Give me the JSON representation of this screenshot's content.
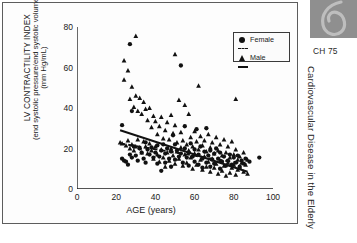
{
  "figure": {
    "chapter_label": "CH 75",
    "running_head": "Cardiovascular Disease in the Elderly",
    "ornament_icon": "swirl-ornament-icon"
  },
  "axes": {
    "ylabel_line1": "LV CONTRACTILITY INDEX",
    "ylabel_line2": "(end systolic pressure/end systolic volume)",
    "ylabel_line3": "(mm Hg/mL)",
    "xlabel": "AGE (years)",
    "yticks": [
      "0",
      "20",
      "40",
      "60",
      "80"
    ],
    "xticks": [
      "0",
      "20",
      "40",
      "60",
      "80",
      "100"
    ]
  },
  "legend": {
    "items": [
      {
        "label": "Female",
        "marker": "circle-marker",
        "line": "dashed-line"
      },
      {
        "label": "Male",
        "marker": "triangle-marker",
        "line": "solid-line"
      }
    ]
  },
  "colors": {
    "marker": "#111111",
    "axis": "#1a1a1a",
    "panel_border": "#5d5d5d",
    "side_block": "#8f8f8f"
  },
  "chart_data": {
    "type": "scatter",
    "title": "",
    "xlabel": "AGE (years)",
    "ylabel": "LV CONTRACTILITY INDEX (end systolic pressure/end systolic volume) (mm Hg/mL)",
    "xlim": [
      0,
      100
    ],
    "ylim": [
      0,
      80
    ],
    "xticks": [
      0,
      20,
      40,
      60,
      80,
      100
    ],
    "yticks": [
      0,
      20,
      40,
      60,
      80
    ],
    "grid": false,
    "legend_position": "top-right",
    "series": [
      {
        "name": "Female",
        "marker": "circle",
        "trendline": {
          "style": "dashed",
          "x": [
            22,
            88
          ],
          "y": [
            22.5,
            12.0
          ]
        },
        "points": [
          [
            23,
            31.5
          ],
          [
            23,
            15.0
          ],
          [
            24,
            14.0
          ],
          [
            25,
            13.5
          ],
          [
            26,
            12.0
          ],
          [
            27,
            71.5
          ],
          [
            27,
            17.0
          ],
          [
            28,
            38.5
          ],
          [
            28,
            15.5
          ],
          [
            29,
            21.0
          ],
          [
            30,
            16.5
          ],
          [
            31,
            14.0
          ],
          [
            32,
            20.0
          ],
          [
            33,
            18.0
          ],
          [
            34,
            15.0
          ],
          [
            35,
            23.0
          ],
          [
            35,
            13.0
          ],
          [
            36,
            19.5
          ],
          [
            37,
            17.0
          ],
          [
            38,
            20.5
          ],
          [
            39,
            15.5
          ],
          [
            40,
            18.0
          ],
          [
            41,
            21.5
          ],
          [
            41,
            12.5
          ],
          [
            42,
            16.0
          ],
          [
            43,
            19.0
          ],
          [
            43,
            9.0
          ],
          [
            44,
            22.0
          ],
          [
            45,
            17.5
          ],
          [
            45,
            13.0
          ],
          [
            46,
            20.0
          ],
          [
            47,
            15.0
          ],
          [
            48,
            18.5
          ],
          [
            48,
            11.0
          ],
          [
            49,
            26.5
          ],
          [
            50,
            22.0
          ],
          [
            50,
            14.5
          ],
          [
            51,
            19.0
          ],
          [
            52,
            16.0
          ],
          [
            53,
            61.0
          ],
          [
            53,
            17.5
          ],
          [
            54,
            13.0
          ],
          [
            55,
            31.0
          ],
          [
            55,
            20.0
          ],
          [
            56,
            15.5
          ],
          [
            57,
            18.0
          ],
          [
            57,
            11.5
          ],
          [
            58,
            22.5
          ],
          [
            59,
            16.0
          ],
          [
            60,
            19.5
          ],
          [
            60,
            13.5
          ],
          [
            61,
            29.5
          ],
          [
            62,
            17.0
          ],
          [
            62,
            12.0
          ],
          [
            63,
            21.0
          ],
          [
            64,
            15.0
          ],
          [
            64,
            10.5
          ],
          [
            65,
            18.5
          ],
          [
            66,
            30.0
          ],
          [
            66,
            13.0
          ],
          [
            67,
            16.5
          ],
          [
            68,
            19.0
          ],
          [
            68,
            11.0
          ],
          [
            69,
            14.5
          ],
          [
            70,
            17.5
          ],
          [
            70,
            12.5
          ],
          [
            71,
            20.0
          ],
          [
            72,
            15.0
          ],
          [
            73,
            18.0
          ],
          [
            73,
            10.0
          ],
          [
            74,
            13.5
          ],
          [
            75,
            16.0
          ],
          [
            76,
            11.5
          ],
          [
            77,
            14.0
          ],
          [
            78,
            17.0
          ],
          [
            79,
            12.0
          ],
          [
            80,
            15.5
          ],
          [
            81,
            13.0
          ],
          [
            82,
            16.5
          ],
          [
            83,
            11.0
          ],
          [
            84,
            14.0
          ],
          [
            85,
            12.5
          ],
          [
            86,
            15.0
          ],
          [
            88,
            13.5
          ],
          [
            93,
            15.5
          ]
        ]
      },
      {
        "name": "Male",
        "marker": "triangle",
        "trendline": {
          "style": "solid",
          "x": [
            22,
            87
          ],
          "y": [
            29.0,
            8.5
          ]
        },
        "points": [
          [
            22,
            23.0
          ],
          [
            23,
            22.5
          ],
          [
            24,
            63.5
          ],
          [
            24,
            54.0
          ],
          [
            25,
            21.5
          ],
          [
            26,
            58.5
          ],
          [
            26,
            24.0
          ],
          [
            27,
            44.5
          ],
          [
            27,
            20.0
          ],
          [
            28,
            50.5
          ],
          [
            28,
            22.0
          ],
          [
            29,
            40.5
          ],
          [
            29,
            19.0
          ],
          [
            30,
            75.5
          ],
          [
            30,
            46.0
          ],
          [
            30,
            21.0
          ],
          [
            31,
            38.5
          ],
          [
            31,
            24.5
          ],
          [
            32,
            45.0
          ],
          [
            32,
            20.5
          ],
          [
            33,
            37.0
          ],
          [
            33,
            18.0
          ],
          [
            34,
            43.0
          ],
          [
            34,
            23.5
          ],
          [
            35,
            39.5
          ],
          [
            35,
            21.0
          ],
          [
            36,
            34.0
          ],
          [
            36,
            17.5
          ],
          [
            37,
            40.0
          ],
          [
            37,
            22.5
          ],
          [
            38,
            30.5
          ],
          [
            38,
            19.0
          ],
          [
            39,
            36.0
          ],
          [
            39,
            15.0
          ],
          [
            40,
            33.5
          ],
          [
            40,
            21.0
          ],
          [
            41,
            27.0
          ],
          [
            41,
            17.0
          ],
          [
            42,
            31.0
          ],
          [
            42,
            13.5
          ],
          [
            43,
            35.5
          ],
          [
            43,
            19.5
          ],
          [
            44,
            25.0
          ],
          [
            44,
            15.5
          ],
          [
            45,
            29.0
          ],
          [
            45,
            11.0
          ],
          [
            46,
            33.0
          ],
          [
            46,
            18.0
          ],
          [
            47,
            24.5
          ],
          [
            47,
            14.0
          ],
          [
            48,
            36.5
          ],
          [
            48,
            20.0
          ],
          [
            49,
            27.5
          ],
          [
            49,
            16.5
          ],
          [
            50,
            66.5
          ],
          [
            50,
            31.5
          ],
          [
            50,
            12.5
          ],
          [
            51,
            23.0
          ],
          [
            51,
            18.5
          ],
          [
            52,
            44.0
          ],
          [
            52,
            15.0
          ],
          [
            53,
            28.0
          ],
          [
            53,
            20.5
          ],
          [
            54,
            24.0
          ],
          [
            54,
            11.5
          ],
          [
            55,
            41.5
          ],
          [
            55,
            17.0
          ],
          [
            56,
            22.0
          ],
          [
            56,
            13.0
          ],
          [
            57,
            37.0
          ],
          [
            57,
            19.0
          ],
          [
            58,
            25.5
          ],
          [
            58,
            15.5
          ],
          [
            59,
            21.0
          ],
          [
            59,
            10.0
          ],
          [
            60,
            28.5
          ],
          [
            60,
            17.5
          ],
          [
            61,
            23.5
          ],
          [
            61,
            12.0
          ],
          [
            62,
            51.0
          ],
          [
            62,
            19.5
          ],
          [
            63,
            26.0
          ],
          [
            63,
            14.5
          ],
          [
            64,
            21.5
          ],
          [
            64,
            9.5
          ],
          [
            65,
            24.0
          ],
          [
            65,
            16.0
          ],
          [
            66,
            18.5
          ],
          [
            66,
            11.0
          ],
          [
            67,
            27.0
          ],
          [
            67,
            13.5
          ],
          [
            68,
            20.5
          ],
          [
            68,
            8.5
          ],
          [
            69,
            23.0
          ],
          [
            69,
            15.0
          ],
          [
            70,
            17.5
          ],
          [
            70,
            10.5
          ],
          [
            71,
            25.5
          ],
          [
            71,
            12.5
          ],
          [
            72,
            19.0
          ],
          [
            72,
            7.5
          ],
          [
            73,
            22.0
          ],
          [
            73,
            14.0
          ],
          [
            74,
            16.5
          ],
          [
            74,
            9.0
          ],
          [
            75,
            24.5
          ],
          [
            75,
            11.5
          ],
          [
            76,
            18.0
          ],
          [
            76,
            6.5
          ],
          [
            77,
            21.0
          ],
          [
            77,
            13.0
          ],
          [
            78,
            15.5
          ],
          [
            78,
            8.0
          ],
          [
            79,
            23.5
          ],
          [
            79,
            10.5
          ],
          [
            80,
            17.0
          ],
          [
            80,
            12.0
          ],
          [
            81,
            44.5
          ],
          [
            81,
            19.5
          ],
          [
            81,
            7.0
          ],
          [
            82,
            14.5
          ],
          [
            82,
            9.5
          ],
          [
            83,
            16.0
          ],
          [
            83,
            11.0
          ],
          [
            84,
            13.0
          ],
          [
            85,
            18.0
          ],
          [
            85,
            8.5
          ],
          [
            86,
            12.0
          ],
          [
            87,
            14.5
          ],
          [
            87,
            7.5
          ]
        ]
      }
    ]
  }
}
